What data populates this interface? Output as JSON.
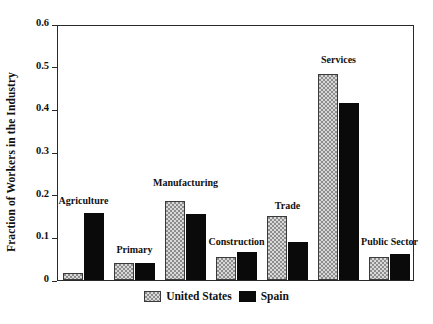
{
  "chart_data": {
    "type": "bar",
    "title": "",
    "xlabel": "",
    "ylabel": "Fraction of Workers in the Industry",
    "ylim": [
      0,
      0.6
    ],
    "yticks": [
      "0",
      "0.1",
      "0.2",
      "0.3",
      "0.4",
      "0.5",
      "0.6"
    ],
    "ytick_values": [
      0,
      0.1,
      0.2,
      0.3,
      0.4,
      0.5,
      0.6
    ],
    "grid": false,
    "legend_position": "below-axis-center",
    "categories": [
      "Agriculture",
      "Primary",
      "Manufacturing",
      "Construction",
      "Trade",
      "Services",
      "Public Sector"
    ],
    "series": [
      {
        "name": "United States",
        "color": "#8d8d8d",
        "pattern": "checkered-hatch",
        "values": [
          0.017,
          0.04,
          0.185,
          0.055,
          0.149,
          0.483,
          0.053
        ]
      },
      {
        "name": "Spain",
        "color": "#0a0a0a",
        "pattern": "solid",
        "values": [
          0.158,
          0.04,
          0.155,
          0.066,
          0.089,
          0.414,
          0.06
        ]
      }
    ],
    "category_label_offsets": [
      0.205,
      0.088,
      0.245,
      0.108,
      0.192,
      0.535,
      0.108
    ]
  },
  "legend": {
    "entries": [
      {
        "label": "United States",
        "swatch": "checkered-gray-swatch"
      },
      {
        "label": "Spain",
        "swatch": "solid-black-swatch"
      }
    ]
  }
}
